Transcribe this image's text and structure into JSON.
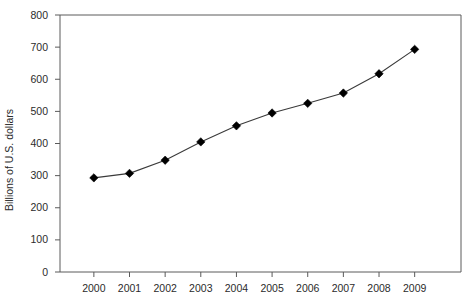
{
  "chart_data": {
    "type": "line",
    "title": "",
    "subtitle": "",
    "xlabel": "",
    "ylabel": "Billions of U.S. dollars",
    "categories": [
      "2000",
      "2001",
      "2002",
      "2003",
      "2004",
      "2005",
      "2006",
      "2007",
      "2008",
      "2009"
    ],
    "values": [
      293,
      307,
      348,
      405,
      455,
      495,
      525,
      557,
      617,
      693
    ],
    "series": [
      {
        "name": "Billions of U.S. dollars",
        "values": [
          293,
          307,
          348,
          405,
          455,
          495,
          525,
          557,
          617,
          693
        ]
      }
    ],
    "ylim": [
      0,
      800
    ],
    "yticks": [
      0,
      100,
      200,
      300,
      400,
      500,
      600,
      700,
      800
    ],
    "ytick_labels": [
      "0",
      "100",
      "200",
      "300",
      "400",
      "500",
      "600",
      "700",
      "800"
    ],
    "xtick_labels": [
      "2000",
      "2001",
      "2002",
      "2003",
      "2004",
      "2005",
      "2006",
      "2007",
      "2008",
      "2009"
    ],
    "grid": false,
    "legend": false,
    "legend_position": "none",
    "marker": "diamond",
    "line_color": "#3a3a3a",
    "marker_color": "#000000",
    "axis_color": "#5a5a5a",
    "text_color": "#2b2b2b",
    "background": "#ffffff"
  }
}
